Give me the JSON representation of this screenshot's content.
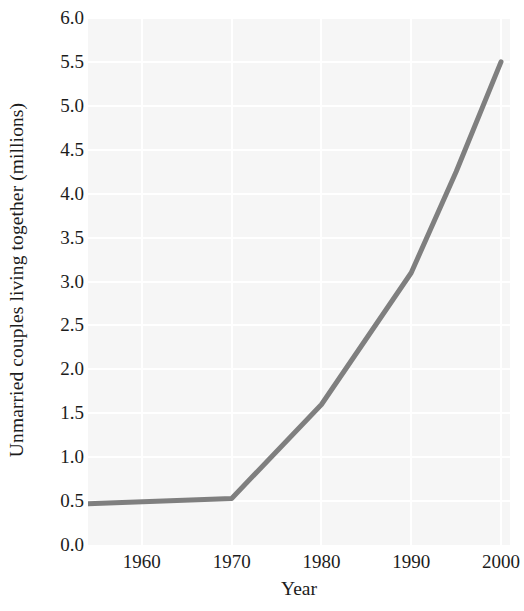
{
  "chart_data": {
    "type": "line",
    "title": "",
    "xlabel": "Year",
    "ylabel": "Unmarried couples living together (millions)",
    "xlim": [
      1954,
      2001
    ],
    "ylim": [
      0.0,
      6.0
    ],
    "grid": true,
    "legend": false,
    "xticks": [
      1960,
      1970,
      1980,
      1990,
      2000
    ],
    "xtick_labels": [
      "1960",
      "1970",
      "1980",
      "1990",
      "2000"
    ],
    "yticks": [
      0.0,
      0.5,
      1.0,
      1.5,
      2.0,
      2.5,
      3.0,
      3.5,
      4.0,
      4.5,
      5.0,
      5.5,
      6.0
    ],
    "ytick_labels": [
      "0.0",
      "0.5",
      "1.0",
      "1.5",
      "2.0",
      "2.5",
      "3.0",
      "3.5",
      "4.0",
      "4.5",
      "5.0",
      "5.5",
      "6.0"
    ],
    "series": [
      {
        "name": "Unmarried couples living together",
        "color": "#7f7f7f",
        "line_width": 5,
        "x": [
          1954,
          1970,
          1980,
          1990,
          1995,
          2000
        ],
        "y": [
          0.47,
          0.53,
          1.6,
          3.1,
          4.25,
          5.5
        ]
      }
    ],
    "colors": {
      "line": "#7f7f7f",
      "plot_background": "#f6f6f6",
      "gridline": "#ffffff",
      "text": "#1c1c1c",
      "figure_background": "#ffffff"
    }
  }
}
